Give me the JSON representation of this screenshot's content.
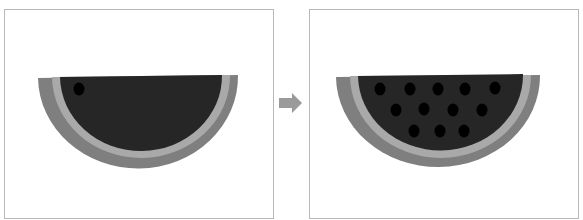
{
  "diagram": {
    "type": "before-after",
    "panels": [
      {
        "id": "before",
        "subject": "watermelon-slice",
        "seed_count": 1,
        "seeds": [
          [
            79,
            89
          ]
        ]
      },
      {
        "id": "after",
        "subject": "watermelon-slice",
        "seed_count": 13,
        "seeds": [
          [
            380,
            89
          ],
          [
            410,
            89
          ],
          [
            438,
            89
          ],
          [
            465,
            89
          ],
          [
            495,
            88
          ],
          [
            396,
            110
          ],
          [
            424,
            109
          ],
          [
            453,
            110
          ],
          [
            482,
            110
          ],
          [
            414,
            131
          ],
          [
            440,
            131
          ],
          [
            464,
            131
          ]
        ]
      }
    ],
    "connector": {
      "type": "arrow",
      "direction": "right"
    }
  },
  "colors": {
    "frame_border": "#b8b8b8",
    "outer_rind": "#7f7f7f",
    "inner_rind": "#a9a9a9",
    "flesh": "#262626",
    "seed": "#000000",
    "arrow": "#9a9a9a"
  }
}
